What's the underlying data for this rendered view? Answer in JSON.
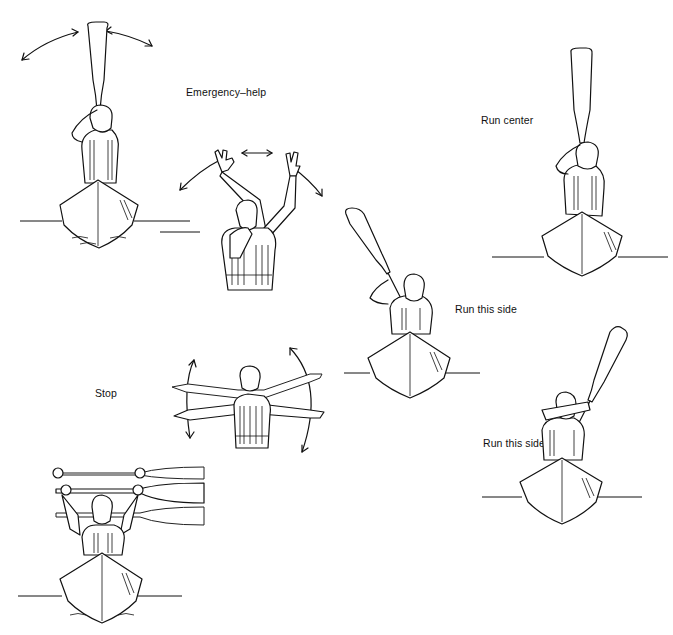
{
  "ink_color": "#111111",
  "background": "#ffffff",
  "signals": [
    {
      "id": "paddle-wave",
      "label": "",
      "depicts": "Paddler in kayak holding paddle vertically overhead, waving side to side (arrows left and right)"
    },
    {
      "id": "emergency-help",
      "label": "Emergency–help",
      "depicts": "Standing person in life vest blowing whistle, both arms raised and waving (arrows)"
    },
    {
      "id": "run-center",
      "label": "Run center",
      "depicts": "Paddler in kayak holding paddle straight up vertically"
    },
    {
      "id": "run-this-side-left",
      "label": "Run this side",
      "depicts": "Paddler in kayak holding paddle angled toward the left"
    },
    {
      "id": "stop",
      "label": "Stop",
      "depicts": "Standing person in life vest with arms extended horizontally, moving up and down (arrows)"
    },
    {
      "id": "run-this-side-right",
      "label": "Run this side",
      "depicts": "Paddler in kayak holding paddle angled toward the right"
    },
    {
      "id": "paddle-overhead",
      "label": "",
      "depicts": "Paddler in kayak holding paddle horizontally overhead, raised and lowered"
    }
  ]
}
